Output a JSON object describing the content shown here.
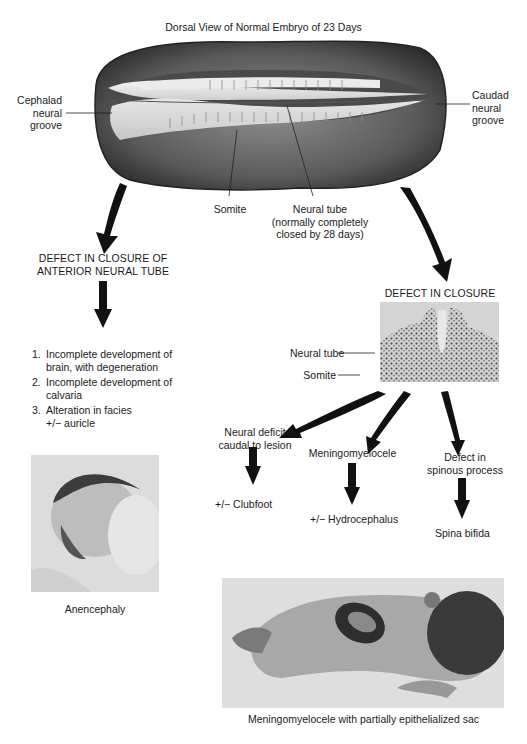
{
  "title": "Dorsal View of Normal Embryo of 23 Days",
  "embryo_labels": {
    "cephalad": [
      "Cephalad",
      "neural",
      "groove"
    ],
    "caudad": [
      "Caudad",
      "neural",
      "groove"
    ],
    "somite": "Somite",
    "neural_tube": [
      "Neural tube",
      "(normally completely",
      "closed by 28 days)"
    ]
  },
  "left_branch": {
    "heading": [
      "DEFECT IN CLOSURE OF",
      "ANTERIOR NEURAL TUBE"
    ],
    "items": [
      {
        "num": "1.",
        "lines": [
          "Incomplete development of",
          "brain, with degeneration"
        ]
      },
      {
        "num": "2.",
        "lines": [
          "Incomplete development of",
          "calvaria"
        ]
      },
      {
        "num": "3.",
        "lines": [
          "Alteration in facies",
          "+/−  auricle"
        ]
      }
    ],
    "photo_caption": "Anencephaly"
  },
  "right_branch": {
    "heading": "DEFECT IN CLOSURE",
    "section_labels": {
      "neural_tube": "Neural tube",
      "somite": "Somite"
    },
    "outcomes": [
      {
        "cause": [
          "Neural deficit",
          "caudal to lesion"
        ],
        "result": "+/−  Clubfoot"
      },
      {
        "cause": [
          "Meningomyelocele"
        ],
        "result": "+/−  Hydrocephalus"
      },
      {
        "cause": [
          "Defect in",
          "spinous process"
        ],
        "result": "Spina bifida"
      }
    ],
    "photo_caption": "Meningomyelocele with partially epithelialized sac"
  },
  "colors": {
    "ink": "#1a1a1a",
    "embryo_dark": "#3a3a3a",
    "embryo_mid": "#7a7a7a",
    "embryo_light": "#e8e8e8",
    "photo_bg": "#d8d8d8"
  }
}
